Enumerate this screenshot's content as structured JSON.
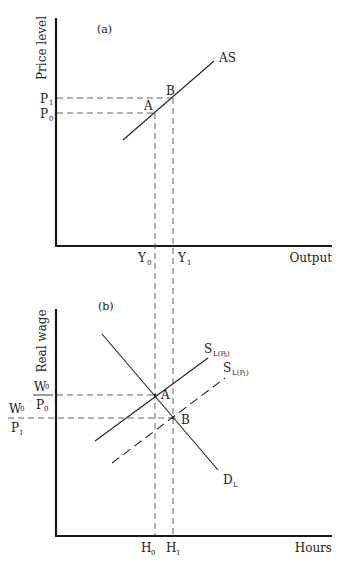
{
  "figure": {
    "panel_a": {
      "label": "(a)",
      "y_axis_label": "Price level",
      "x_axis_label": "Output",
      "curve_label": "AS",
      "point_a": "A",
      "point_b": "B",
      "p1": {
        "main": "P",
        "sub": "1"
      },
      "p0": {
        "main": "P",
        "sub": "0"
      },
      "y0": {
        "main": "Y",
        "sub": "0"
      },
      "y1": {
        "main": "Y",
        "sub": "1"
      }
    },
    "panel_b": {
      "label": "(b)",
      "y_axis_label": "Real wage",
      "x_axis_label": "Hours",
      "supply0": {
        "main": "S",
        "sub": "L(P",
        "subsub": "0",
        "close": ")"
      },
      "supply1": {
        "main": "S",
        "sub": "L(P",
        "subsub": "1",
        "close": ")"
      },
      "demand": {
        "main": "D",
        "sub": "L"
      },
      "point_a": "A",
      "point_b": "B",
      "w0p0": {
        "num_main": "W",
        "num_sub": "0",
        "den_main": "P",
        "den_sub": "0"
      },
      "w0p1": {
        "num_main": "W",
        "num_sub": "0",
        "den_main": "P",
        "den_sub": "1"
      },
      "h0": {
        "main": "H",
        "sub": "0"
      },
      "h1": {
        "main": "H",
        "sub": "1"
      }
    }
  }
}
